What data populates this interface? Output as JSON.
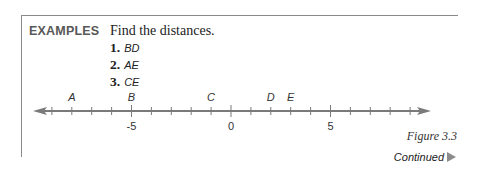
{
  "header": {
    "section_label": "EXAMPLES",
    "instruction": "Find the distances."
  },
  "examples": [
    {
      "number": "1.",
      "segment": "BD"
    },
    {
      "number": "2.",
      "segment": "AE"
    },
    {
      "number": "3.",
      "segment": "CE"
    }
  ],
  "number_line": {
    "min_tick": -9,
    "max_tick": 9,
    "labeled_ticks": [
      {
        "value": -5,
        "label": "-5"
      },
      {
        "value": 0,
        "label": "0"
      },
      {
        "value": 5,
        "label": "5"
      }
    ],
    "points": [
      {
        "label": "A",
        "value": -8
      },
      {
        "label": "B",
        "value": -5
      },
      {
        "label": "C",
        "value": -1
      },
      {
        "label": "D",
        "value": 2
      },
      {
        "label": "E",
        "value": 3
      }
    ],
    "line_color": "#7a7a7a"
  },
  "caption": {
    "figure": "Figure 3.3",
    "continued": "Continued"
  }
}
